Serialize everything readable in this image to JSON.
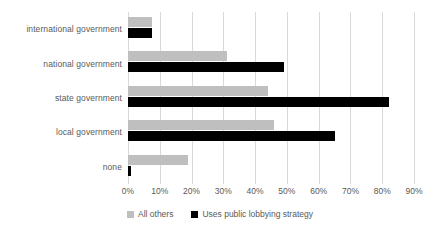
{
  "chart_data": {
    "type": "bar",
    "orientation": "horizontal",
    "title": "",
    "xlabel": "",
    "ylabel": "",
    "xlim": [
      0,
      90
    ],
    "grid": true,
    "legend_position": "bottom",
    "categories": [
      "international government",
      "national government",
      "state government",
      "local government",
      "none"
    ],
    "tick_labels": [
      "0%",
      "10%",
      "20%",
      "30%",
      "40%",
      "50%",
      "60%",
      "70%",
      "80%",
      "90%"
    ],
    "tick_values": [
      0,
      10,
      20,
      30,
      40,
      50,
      60,
      70,
      80,
      90
    ],
    "series": [
      {
        "name": "All others",
        "color": "#bfbfbf",
        "values": [
          7.5,
          31,
          44,
          46,
          19
        ]
      },
      {
        "name": "Uses public lobbying strategy",
        "color": "#000000",
        "values": [
          7.5,
          49,
          82,
          65,
          1
        ]
      }
    ]
  }
}
